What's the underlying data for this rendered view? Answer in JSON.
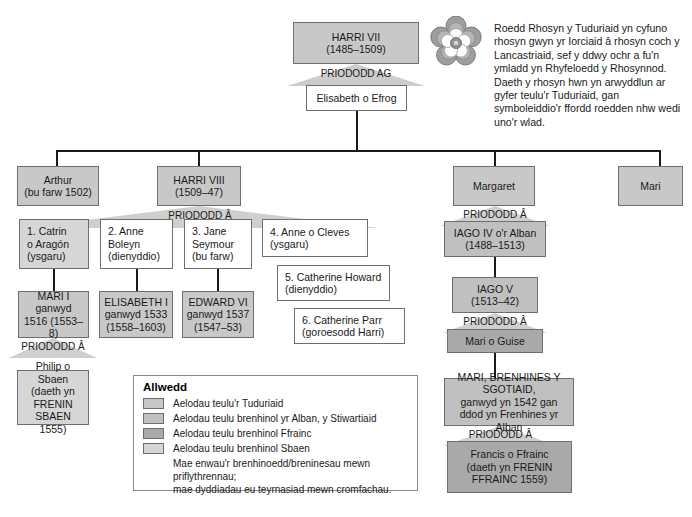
{
  "intro": {
    "text": "Roedd Rhosyn y Tuduriaid yn cyfuno rhosyn gwyn yr Iorciaid â rhosyn coch y Lancastriaid, sef y ddwy ochr a fu'n ymladd yn Rhyfeloedd y Rhosynnod. Daeth y rhosyn hwn yn arwyddlun ar gyfer teulu'r Tuduriaid, gan symboleiddio'r ffordd roedden nhw wedi uno'r wlad."
  },
  "rose": {
    "icon": "tudor-rose-icon"
  },
  "marriage_labels": {
    "ag": "PRIODODD AG",
    "a": "PRIODODD Â"
  },
  "nodes": {
    "harri_vii": "HARRI VII\n(1485–1509)",
    "elisabeth_efrog": "Elisabeth o Efrog",
    "arthur": "Arthur\n(bu farw 1502)",
    "harri_viii": "HARRI VIII\n(1509–47)",
    "margaret": "Margaret",
    "mari": "Mari",
    "wife1": "1. Catrin\n    o Aragón\n    (ysgaru)",
    "wife2": "2. Anne\n    Boleyn\n    (dienyddio)",
    "wife3": "3. Jane\n    Seymour\n    (bu farw)",
    "wife4": "4. Anne o Cleves\n    (ysgaru)",
    "wife5": "5. Catherine Howard\n    (dienyddio)",
    "wife6": "6. Catherine Parr\n    (goroesodd Harri)",
    "mari_i": "MARI I\nganwyd\n1516 (1553–8)",
    "elisabeth_i": "ELISABETH I\nganwyd 1533\n(1558–1603)",
    "edward_vi": "EDWARD VI\nganwyd 1537\n(1547–53)",
    "philip_sbaen": "Philip o Sbaen\n(daeth yn\nFRENIN\nSBAEN 1555)",
    "iago_iv": "IAGO IV o'r Alban\n(1488–1513)",
    "iago_v": "IAGO V\n(1513–42)",
    "mari_guise": "Mari o Guise",
    "mari_sgotiaid": "MARI, BRENHINES Y SGOTIAID,\nganwyd yn 1542 gan\nddod yn Frenhines yr Alban",
    "francis_ffrainc": "Francis o Ffrainc\n(daeth yn FRENIN\nFFRAINC 1559)"
  },
  "legend": {
    "title": "Allwedd",
    "items": [
      {
        "color": "#c8c8c8",
        "label": "Aelodau teulu'r Tuduriaid"
      },
      {
        "color": "#c0c0c0",
        "label": "Aelodau teulu brenhinol yr Alban, y Stiwartiaid"
      },
      {
        "color": "#a9a9a9",
        "label": "Aelodau teulu brenhinol Ffrainc"
      },
      {
        "color": "#d6d6d6",
        "label": "Aelodau teulu brenhinol Sbaen"
      }
    ],
    "note": "Mae enwau'r brenhinoedd/breninesau mewn priflythrennau;\nmae dyddiadau eu teyrnasiad mewn cromfachau."
  },
  "colors": {
    "tudor": "#c8c8c8",
    "stewart": "#c0c0c0",
    "france": "#a9a9a9",
    "spain": "#d6d6d6",
    "line": "#1a1a1a",
    "border": "#6e6e6e"
  }
}
